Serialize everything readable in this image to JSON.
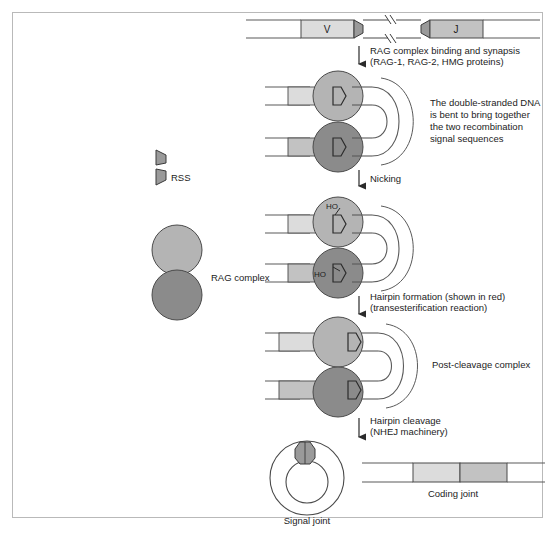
{
  "figure": {
    "segments": {
      "v_label": "V",
      "j_label": "J",
      "break_marks": "//"
    },
    "legend": {
      "rss_label": "RSS",
      "rag_label": "RAG complex"
    },
    "steps": [
      {
        "id": "step-binding",
        "line1": "RAG complex binding and synapsis",
        "line2": "(RAG-1, RAG-2, HMG proteins)"
      },
      {
        "id": "step-nicking",
        "line1": "Nicking",
        "line2": ""
      },
      {
        "id": "step-hairpin-formation",
        "line1": "Hairpin formation (shown in red)",
        "line2": "(transesterification reaction)"
      },
      {
        "id": "step-hairpin-cleavage",
        "line1": "Hairpin cleavage",
        "line2": "(NHEJ machinery)"
      }
    ],
    "annotations": {
      "synapsis_note": [
        "The double-stranded DNA",
        "is bent to bring together",
        "the two recombination",
        "signal sequences"
      ],
      "post_cleavage_label": "Post-cleavage complex",
      "nick_marker": "HO",
      "signal_joint_label": "Signal joint",
      "coding_joint_label": "Coding joint"
    },
    "colors": {
      "rag_upper": "#b4b4b4",
      "rag_lower": "#8b8b8b",
      "coding_segment_light": "#dcdcdc",
      "coding_segment_dark": "#c2c2c2",
      "rss_fill": "#9a9a9a",
      "dna_line": "#5a5a5a",
      "outline": "#3a3a3a",
      "frame": "#b9b9b9",
      "text": "#1c1c1c"
    }
  }
}
